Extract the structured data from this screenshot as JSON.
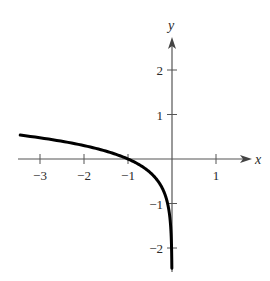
{
  "chart_data": {
    "type": "line",
    "title": "",
    "function": "y = log10(-x)",
    "xlabel": "x",
    "ylabel": "y",
    "xlim": [
      -3.45,
      1.75
    ],
    "ylim": [
      -2.5,
      2.75
    ],
    "grid": false,
    "legend": null,
    "x_ticks": [
      -3,
      -2,
      -1,
      1
    ],
    "x_tick_labels": [
      "−3",
      "−2",
      "−1",
      "1"
    ],
    "y_ticks": [
      2,
      1,
      -1,
      -2
    ],
    "y_tick_labels": [
      "2",
      "1",
      "−1",
      "−2"
    ],
    "series": [
      {
        "name": "y = log10(-x)",
        "x": [
          -3.45,
          -3,
          -2.5,
          -2,
          -1.5,
          -1,
          -0.75,
          -0.5,
          -0.3,
          -0.2,
          -0.1,
          -0.05,
          -0.02,
          -0.01,
          -0.0035
        ],
        "y": [
          0.54,
          0.48,
          0.4,
          0.3,
          0.18,
          0.0,
          -0.12,
          -0.3,
          -0.52,
          -0.7,
          -1.0,
          -1.3,
          -1.7,
          -2.0,
          -2.45
        ]
      }
    ],
    "colors": {
      "axis": "#555555",
      "curve": "#000000",
      "text": "#2a2a2a"
    }
  }
}
